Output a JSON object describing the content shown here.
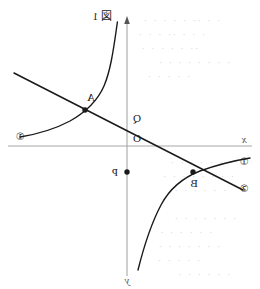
{
  "figure": {
    "title_label": "図 1",
    "axes": {
      "x_label": "x",
      "y_label": "y",
      "origin_label": "O",
      "x_axis_color": "#a8a8a8",
      "y_axis_color": "#a8a8a8"
    },
    "points": [
      {
        "id": "A",
        "label": "A",
        "x": 175,
        "y": 110,
        "marked": true
      },
      {
        "id": "B",
        "label": "B",
        "x": 67,
        "y": 172,
        "marked": true
      },
      {
        "id": "P",
        "label": "P",
        "x": 133,
        "y": 172,
        "marked": true
      },
      {
        "id": "Q",
        "label": "Q",
        "x": 133,
        "y": 118,
        "marked": false
      }
    ],
    "curve_labels": [
      {
        "id": "curve-1-right",
        "label": "①",
        "x": 240,
        "y": 133
      },
      {
        "id": "curve-1-left",
        "label": "①",
        "x": 16,
        "y": 162
      },
      {
        "id": "line-2",
        "label": "②",
        "x": 16,
        "y": 186
      }
    ],
    "curve_color": "#1a1a1a",
    "line_color": "#1a1a1a"
  },
  "chart_data": {
    "type": "line",
    "title": "図 1",
    "xlabel": "x",
    "ylabel": "y",
    "grid": false,
    "legend": "inline-circled-labels",
    "xlim": [
      -3.9,
      3.9
    ],
    "ylim": [
      -3.2,
      3.3
    ],
    "origin_px": {
      "x": 133,
      "y": 146
    },
    "scale_px_per_unit": {
      "x": 30,
      "y": 30
    },
    "series": [
      {
        "name": "①",
        "kind": "hyperbola",
        "equation": "y = k / x",
        "k": 2.6,
        "branches": [
          "upper-right",
          "lower-left"
        ],
        "label_positions": [
          "right-end",
          "left-end"
        ]
      },
      {
        "name": "②",
        "kind": "line",
        "equation": "y = a x + b",
        "slope": 0.55,
        "intercept": 0.93,
        "x_range": [
          -3.85,
          3.7
        ]
      }
    ],
    "annotations": [
      {
        "text": "A",
        "x": 1.4,
        "y": 1.2,
        "note": "intersection of ① and ② on upper-right branch"
      },
      {
        "text": "B",
        "x": -2.2,
        "y": -0.87,
        "note": "intersection of ① and ② on lower-left branch"
      },
      {
        "text": "Q",
        "x": 0,
        "y": 0.93,
        "note": "y-intercept of line ②"
      },
      {
        "text": "P",
        "x": 0,
        "y": -0.87,
        "note": "marked point on negative y-axis"
      },
      {
        "text": "O",
        "x": 0,
        "y": 0,
        "note": "origin"
      }
    ]
  },
  "bleed_through": {
    "lines": [
      {
        "text": "· · ·· · · · · ·",
        "x": 40,
        "y": 16
      },
      {
        "text": "· · · ·· · · ·",
        "x": 55,
        "y": 30
      },
      {
        "text": "·· · · · · ·",
        "x": 62,
        "y": 44
      },
      {
        "text": "· · · · · · · ·",
        "x": 30,
        "y": 58
      },
      {
        "text": "· · · · ·",
        "x": 70,
        "y": 72
      },
      {
        "text": "· · · · · · ·",
        "x": 28,
        "y": 158
      },
      {
        "text": "· · · · · · · ·",
        "x": 26,
        "y": 172
      },
      {
        "text": "· · · · · ·",
        "x": 34,
        "y": 186
      },
      {
        "text": "· · · · · · ·",
        "x": 24,
        "y": 214
      },
      {
        "text": "· · · · · ·",
        "x": 48,
        "y": 228
      },
      {
        "text": "· · · · · · ·",
        "x": 40,
        "y": 242
      },
      {
        "text": "· · · · ·",
        "x": 60,
        "y": 256
      },
      {
        "text": "· · · · · ·",
        "x": 30,
        "y": 270
      }
    ]
  }
}
